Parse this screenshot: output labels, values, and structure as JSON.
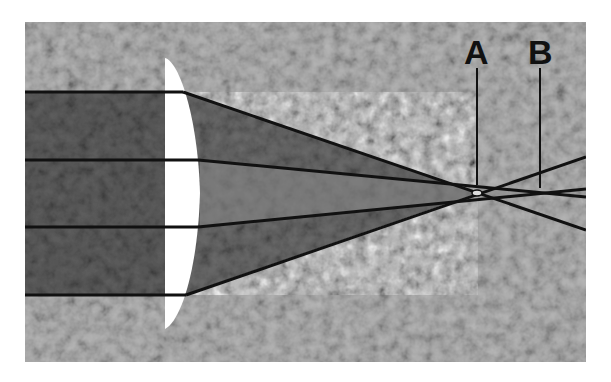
{
  "diagram": {
    "labels": {
      "a": "A",
      "b": "B"
    },
    "colors": {
      "background_texture": "#9a9a9a",
      "beam_shade": "#4a4a4a",
      "lens": "#ffffff",
      "ray": "#111111"
    },
    "rays": [
      {
        "name": "outer-top",
        "focus": "A"
      },
      {
        "name": "inner-top",
        "focus": "B"
      },
      {
        "name": "inner-bottom",
        "focus": "B"
      },
      {
        "name": "outer-bottom",
        "focus": "A"
      }
    ]
  }
}
